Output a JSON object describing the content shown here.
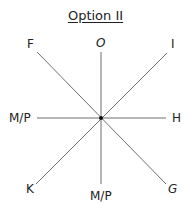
{
  "title": "Option II",
  "center": {
    "x": 101,
    "y": 118
  },
  "axes": [
    {
      "name": "vertical",
      "from": [
        101,
        52
      ],
      "to": [
        101,
        184
      ]
    },
    {
      "name": "horizontal",
      "from": [
        37,
        118
      ],
      "to": [
        166,
        118
      ]
    },
    {
      "name": "diag-down",
      "from": [
        37,
        52
      ],
      "to": [
        166,
        184
      ]
    },
    {
      "name": "diag-up",
      "from": [
        167,
        53
      ],
      "to": [
        36,
        184
      ]
    }
  ],
  "labels": {
    "top": "O",
    "top_left": "F",
    "top_right": "I",
    "left": "M/P",
    "right": "H",
    "bottom_left": "K",
    "bottom": "M/P",
    "bottom_right": "G"
  },
  "colors": {
    "line": "#6e6e6e",
    "text": "#222222",
    "center": "#111111"
  }
}
